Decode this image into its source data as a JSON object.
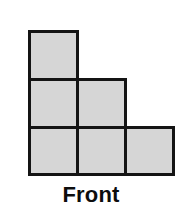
{
  "figure": {
    "name": "front-view-cube-stack",
    "caption": "Front",
    "colors": {
      "cell_fill": "#d6d6d6",
      "cell_stroke": "#141414",
      "background": "#ffffff",
      "caption_color": "#0d0d0d"
    },
    "grid": {
      "columns": 3,
      "rows": 3,
      "cell_size_px": 48,
      "origin_x_px": 28,
      "origin_y_px": 30,
      "occupied_count": 6,
      "column_heights": [
        3,
        2,
        1
      ],
      "cells": [
        {
          "id": "cell-c0-r0",
          "col": 0,
          "row": 0,
          "filled": true
        },
        {
          "id": "cell-c0-r1",
          "col": 0,
          "row": 1,
          "filled": true
        },
        {
          "id": "cell-c0-r2",
          "col": 0,
          "row": 2,
          "filled": true
        },
        {
          "id": "cell-c1-r1",
          "col": 1,
          "row": 1,
          "filled": true
        },
        {
          "id": "cell-c1-r2",
          "col": 1,
          "row": 2,
          "filled": true
        },
        {
          "id": "cell-c2-r2",
          "col": 2,
          "row": 2,
          "filled": true
        }
      ]
    }
  }
}
